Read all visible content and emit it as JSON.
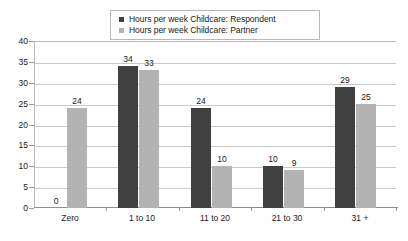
{
  "chart_data": {
    "type": "bar",
    "title": "",
    "subtitle": "",
    "xlabel": "",
    "ylabel": "",
    "ylim": [
      0,
      40
    ],
    "ytick_step": 5,
    "yticks": [
      "0",
      "5",
      "10",
      "15",
      "20",
      "25",
      "30",
      "35",
      "40"
    ],
    "grid": true,
    "legend_position": "top-center",
    "categories": [
      "Zero",
      "1 to 10",
      "11 to 20",
      "21 to 30",
      "31 +"
    ],
    "series": [
      {
        "name": "Hours per week Childcare:  Respondent",
        "color": "#404040",
        "values": [
          0,
          34,
          24,
          10,
          29
        ],
        "labels": [
          "0",
          "34",
          "24",
          "10",
          "29"
        ]
      },
      {
        "name": "Hours per week Childcare:  Partner",
        "color": "#b3b3b3",
        "values": [
          24,
          33,
          10,
          9,
          25
        ],
        "labels": [
          "24",
          "33",
          "10",
          "9",
          "25"
        ]
      }
    ]
  },
  "legend": {
    "items": [
      {
        "label": "Hours per week Childcare:  Respondent",
        "swatch_color": "#404040",
        "swatch_name": "legend-swatch-respondent"
      },
      {
        "label": "Hours per week Childcare:  Partner",
        "swatch_color": "#b3b3b3",
        "swatch_name": "legend-swatch-partner"
      }
    ]
  },
  "axes": {
    "y_tick_labels": [
      "40",
      "35",
      "30",
      "25",
      "20",
      "15",
      "10",
      "5",
      "0"
    ],
    "x_tick_labels": [
      "Zero",
      "1 to 10",
      "11 to 20",
      "21 to 30",
      "31 +"
    ]
  },
  "colors": {
    "respondent": "#404040",
    "partner": "#b3b3b3",
    "gridline": "#c9c9c9",
    "frame": "#bcbcbc",
    "axis": "#8f8f8f",
    "text": "#1a1a1a",
    "background": "#ffffff"
  }
}
